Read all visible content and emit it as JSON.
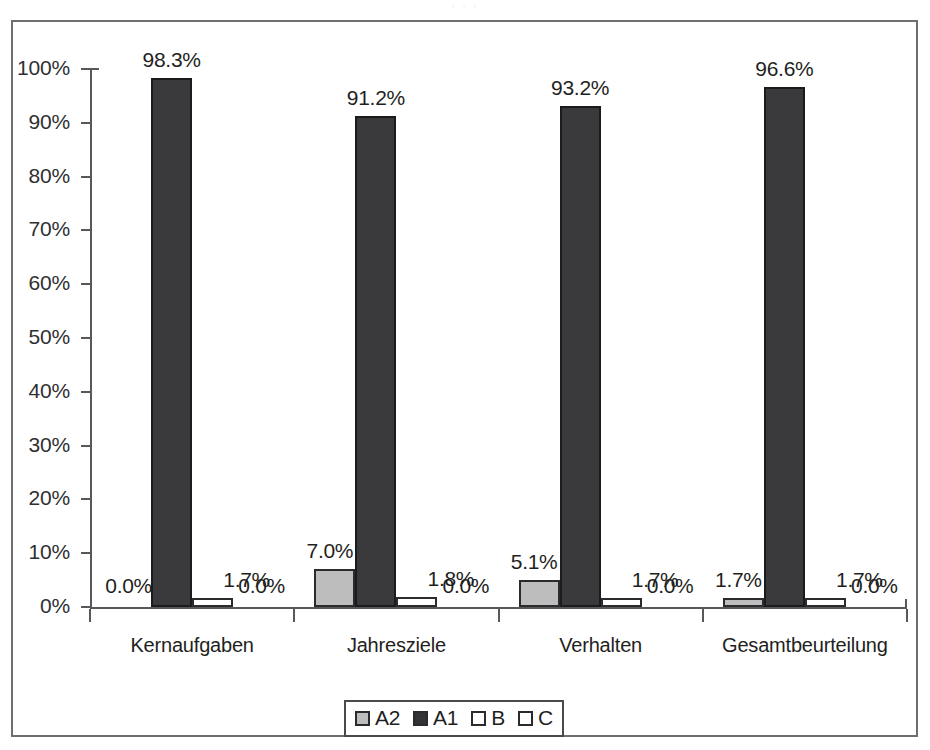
{
  "page": {
    "ghost_title_fragment": "·   ·   ·"
  },
  "chart_data": {
    "type": "bar",
    "title": "",
    "xlabel": "",
    "ylabel": "",
    "ylim": [
      0,
      100
    ],
    "y_ticks": [
      0,
      10,
      20,
      30,
      40,
      50,
      60,
      70,
      80,
      90,
      100
    ],
    "y_tick_labels": [
      "0%",
      "10%",
      "20%",
      "30%",
      "40%",
      "50%",
      "60%",
      "70%",
      "80%",
      "90%",
      "100%"
    ],
    "grid": false,
    "legend_position": "bottom-center",
    "categories": [
      "Kernaufgaben",
      "Jahresziele",
      "Verhalten",
      "Gesamtbeurteilung"
    ],
    "series": [
      {
        "name": "A2",
        "color": "#bdbdbd",
        "values": [
          0.0,
          7.0,
          5.1,
          1.7
        ],
        "labels": [
          "0.0%",
          "7.0%",
          "5.1%",
          "1.7%"
        ]
      },
      {
        "name": "A1",
        "color": "#3a3a3c",
        "values": [
          98.3,
          91.2,
          93.2,
          96.6
        ],
        "labels": [
          "98.3%",
          "91.2%",
          "93.2%",
          "96.6%"
        ]
      },
      {
        "name": "B",
        "color": "#ffffff",
        "values": [
          1.7,
          1.8,
          1.7,
          1.7
        ],
        "labels": [
          "1.7%",
          "1.8%",
          "1.7%",
          "1.7%"
        ]
      },
      {
        "name": "C",
        "color": "#ffffff",
        "values": [
          0.0,
          0.0,
          0.0,
          0.0
        ],
        "labels": [
          "0.0%",
          "0.0%",
          "0.0%",
          "0.0%"
        ]
      }
    ]
  },
  "legend": {
    "items": [
      {
        "label": "A2",
        "swatch": "legend-swatch-a2"
      },
      {
        "label": "A1",
        "swatch": "legend-swatch-a1"
      },
      {
        "label": "B",
        "swatch": "legend-swatch-b"
      },
      {
        "label": "C",
        "swatch": "legend-swatch-c"
      }
    ]
  }
}
